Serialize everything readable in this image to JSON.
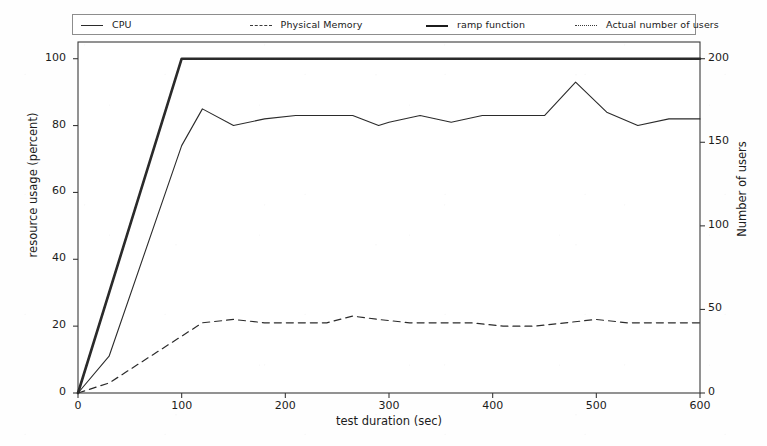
{
  "chart_data": {
    "type": "line",
    "title": "",
    "xlabel": "test duration (sec)",
    "ylabel": "resource usage (percent)",
    "ylabel_right": "Number of users",
    "xlim": [
      0,
      600
    ],
    "ylim": [
      0,
      105
    ],
    "ylim_right": [
      0,
      210
    ],
    "xticks": [
      0,
      100,
      200,
      300,
      400,
      500,
      600
    ],
    "yticks": [
      0,
      20,
      40,
      60,
      80,
      100
    ],
    "yticks_right": [
      0,
      50,
      100,
      150,
      200
    ],
    "grid": false,
    "legend_position": "above-plot",
    "series": [
      {
        "name": "CPU",
        "style": "solid",
        "axis": "left",
        "unit": "percent",
        "x": [
          0,
          30,
          100,
          120,
          150,
          180,
          210,
          240,
          265,
          290,
          300,
          330,
          360,
          390,
          420,
          450,
          480,
          510,
          540,
          570,
          600
        ],
        "values": [
          0,
          11,
          74,
          85,
          80,
          82,
          83,
          83,
          83,
          80,
          81,
          83,
          81,
          83,
          83,
          83,
          93,
          84,
          80,
          82,
          82
        ]
      },
      {
        "name": "Physical Memory",
        "style": "dashed",
        "axis": "left",
        "unit": "percent",
        "x": [
          0,
          30,
          60,
          90,
          120,
          150,
          180,
          210,
          240,
          265,
          290,
          320,
          350,
          380,
          410,
          440,
          470,
          500,
          530,
          560,
          600
        ],
        "values": [
          0,
          3,
          9,
          15,
          21,
          22,
          21,
          21,
          21,
          23,
          22,
          21,
          21,
          21,
          20,
          20,
          21,
          22,
          21,
          21,
          21
        ]
      },
      {
        "name": "ramp function",
        "style": "thick-solid",
        "axis": "left",
        "unit": "percent",
        "x": [
          0,
          100,
          600
        ],
        "values": [
          0,
          100,
          100
        ]
      },
      {
        "name": "Actual number of users",
        "style": "dotted",
        "axis": "right",
        "unit": "users",
        "x": [
          0,
          100,
          600
        ],
        "values": [
          0,
          200,
          200
        ]
      }
    ],
    "legend": [
      {
        "label": "CPU",
        "style": "solid"
      },
      {
        "label": "Physical Memory",
        "style": "dashed"
      },
      {
        "label": "ramp function",
        "style": "thick-solid"
      },
      {
        "label": "Actual number of users",
        "style": "dotted"
      }
    ],
    "colors": {
      "line": "#2b2b2b",
      "axis": "#3a3a3a",
      "background": "#ffffff",
      "text": "#1c1c1c"
    }
  },
  "axis_text": {
    "x_ticks": [
      "0",
      "100",
      "200",
      "300",
      "400",
      "500",
      "600"
    ],
    "y_ticks_left": [
      "0",
      "20",
      "40",
      "60",
      "80",
      "100"
    ],
    "y_ticks_right": [
      "0",
      "50",
      "100",
      "150",
      "200"
    ],
    "xlabel": "test duration (sec)",
    "ylabel_left": "resource usage (percent)",
    "ylabel_right": "Number of users"
  }
}
